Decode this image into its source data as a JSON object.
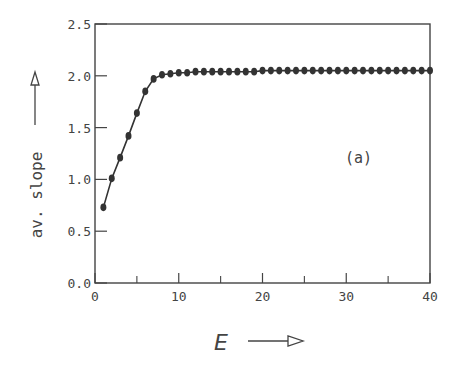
{
  "chart_data": {
    "type": "line",
    "title": "",
    "panel_label": "(a)",
    "xlabel": "E",
    "ylabel": "av. slope",
    "xlim": [
      0,
      40
    ],
    "ylim": [
      0.0,
      2.5
    ],
    "x_ticks": [
      0,
      10,
      20,
      30,
      40
    ],
    "x_ticks_minor": [
      5,
      15,
      25,
      35
    ],
    "y_ticks": [
      0.0,
      0.5,
      1.0,
      1.5,
      2.0,
      2.5
    ],
    "x_tick_labels": [
      "0",
      "10",
      "20",
      "30",
      "40"
    ],
    "y_tick_labels": [
      "0.0",
      "0.5",
      "1.0",
      "1.5",
      "2.0",
      "2.5"
    ],
    "grid": false,
    "legend": null,
    "series": [
      {
        "name": "av. slope",
        "marker": "filled-circle",
        "x": [
          1,
          2,
          3,
          4,
          5,
          6,
          7,
          8,
          9,
          10,
          11,
          12,
          13,
          14,
          15,
          16,
          17,
          18,
          19,
          20,
          21,
          22,
          23,
          24,
          25,
          26,
          27,
          28,
          29,
          30,
          31,
          32,
          33,
          34,
          35,
          36,
          37,
          38,
          39,
          40
        ],
        "values": [
          0.73,
          1.01,
          1.21,
          1.42,
          1.64,
          1.85,
          1.97,
          2.01,
          2.02,
          2.03,
          2.03,
          2.04,
          2.04,
          2.04,
          2.04,
          2.04,
          2.04,
          2.04,
          2.04,
          2.05,
          2.05,
          2.05,
          2.05,
          2.05,
          2.05,
          2.05,
          2.05,
          2.05,
          2.05,
          2.05,
          2.05,
          2.05,
          2.05,
          2.05,
          2.05,
          2.05,
          2.05,
          2.05,
          2.05,
          2.05
        ]
      }
    ]
  },
  "labels": {
    "panel": "(a)",
    "xlabel": "E",
    "ylabel": "av. slope"
  }
}
